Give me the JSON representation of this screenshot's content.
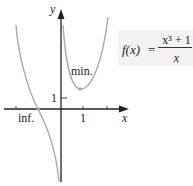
{
  "figure": {
    "formula": {
      "lhs": "f(x)",
      "equals": "=",
      "numerator": "x³ + 1",
      "denominator": "x"
    },
    "axes": {
      "x_label": "x",
      "y_label": "y",
      "x_tick_label": "1",
      "y_tick_label": "1"
    },
    "annotations": {
      "minimum": "min.",
      "inflection": "inf."
    },
    "colors": {
      "curve": "#aaaaaa",
      "axes": "#222222",
      "formula_bg": "#f3f3f3"
    }
  }
}
